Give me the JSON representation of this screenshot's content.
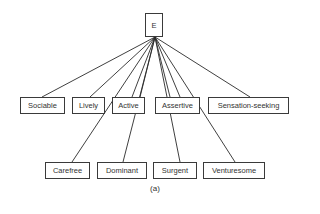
{
  "root": {
    "label": "E",
    "x": 145,
    "y": 13,
    "w": 18,
    "h": 24
  },
  "anchor": {
    "x": 155,
    "y": 37
  },
  "row1": [
    {
      "label": "Sociable",
      "x": 20,
      "y": 97,
      "w": 45,
      "h": 17
    },
    {
      "label": "Lively",
      "x": 72,
      "y": 97,
      "w": 33,
      "h": 17
    },
    {
      "label": "Active",
      "x": 112,
      "y": 97,
      "w": 33,
      "h": 17
    },
    {
      "label": "Assertive",
      "x": 155,
      "y": 97,
      "w": 45,
      "h": 17
    },
    {
      "label": "Sensation-seeking",
      "x": 208,
      "y": 97,
      "w": 81,
      "h": 17
    }
  ],
  "row2": [
    {
      "label": "Carefree",
      "x": 45,
      "y": 162,
      "w": 45,
      "h": 17
    },
    {
      "label": "Dominant",
      "x": 97,
      "y": 162,
      "w": 50,
      "h": 17
    },
    {
      "label": "Surgent",
      "x": 153,
      "y": 162,
      "w": 44,
      "h": 17
    },
    {
      "label": "Venturesome",
      "x": 203,
      "y": 162,
      "w": 62,
      "h": 17
    }
  ],
  "edges": [
    {
      "to": "Sociable",
      "x": 42,
      "y": 97
    },
    {
      "to": "Lively",
      "x": 90,
      "y": 97
    },
    {
      "to": "Active",
      "x": 132,
      "y": 97
    },
    {
      "to": "Active",
      "x": 140,
      "y": 97
    },
    {
      "to": "Assertive",
      "x": 170,
      "y": 97
    },
    {
      "to": "Assertive",
      "x": 180,
      "y": 97
    },
    {
      "to": "Sensation-seeking",
      "x": 250,
      "y": 97
    },
    {
      "to": "Carefree",
      "x": 72,
      "y": 162
    },
    {
      "to": "Dominant",
      "x": 123,
      "y": 162
    },
    {
      "to": "Surgent",
      "x": 180,
      "y": 162
    },
    {
      "to": "Venturesome",
      "x": 235,
      "y": 162
    }
  ],
  "caption": {
    "label": "(a)",
    "x": 135,
    "y": 184
  }
}
